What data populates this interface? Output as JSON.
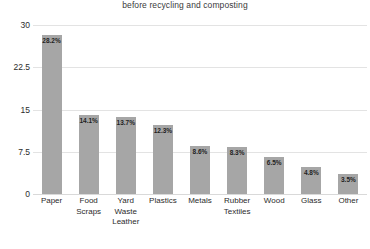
{
  "chart_data": {
    "type": "bar",
    "title": "before recycling and composting",
    "xlabel": "",
    "ylabel": "",
    "ylim": [
      0,
      30
    ],
    "yticks": [
      "0",
      "7.5",
      "15",
      "22.5",
      "30"
    ],
    "grid": true,
    "legend": "none",
    "bar_color": "#a6a6a6",
    "gridline_color": "#e3e3e3",
    "categories": [
      "Paper",
      "Food Scraps",
      "Yard Waste Leather",
      "Plastics",
      "Metals",
      "Rubber Textiles",
      "Wood",
      "Glass",
      "Other"
    ],
    "category_lines": [
      [
        "Paper"
      ],
      [
        "Food",
        "Scraps"
      ],
      [
        "Yard Waste",
        "Leather"
      ],
      [
        "Plastics"
      ],
      [
        "Metals"
      ],
      [
        "Rubber",
        "Textiles"
      ],
      [
        "Wood"
      ],
      [
        "Glass"
      ],
      [
        "Other"
      ]
    ],
    "values": [
      28.2,
      14.1,
      13.7,
      12.3,
      8.6,
      8.3,
      6.5,
      4.8,
      3.5
    ],
    "value_labels": [
      "28.2%",
      "14.1%",
      "13.7%",
      "12.3%",
      "8.6%",
      "8.3%",
      "6.5%",
      "4.8%",
      "3.5%"
    ]
  }
}
